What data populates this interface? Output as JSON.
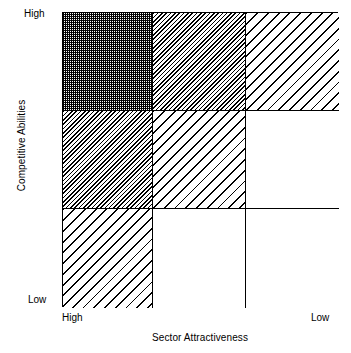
{
  "chart_data": {
    "type": "heatmap",
    "title": "",
    "xlabel": "Sector Attractiveness",
    "ylabel": "Competitive Abilities",
    "x_tick_labels": [
      "High",
      "Low"
    ],
    "y_tick_labels": [
      "High",
      "Low"
    ],
    "grid": true,
    "legend": "none",
    "columns": [
      "High",
      "Medium",
      "Low"
    ],
    "rows": [
      "High",
      "Medium",
      "Low"
    ],
    "cells": [
      {
        "row": 0,
        "col": 0,
        "fill": "stipple",
        "intensity": 3
      },
      {
        "row": 0,
        "col": 1,
        "fill": "hatch-dense",
        "intensity": 2
      },
      {
        "row": 0,
        "col": 2,
        "fill": "hatch-sparse",
        "intensity": 1
      },
      {
        "row": 1,
        "col": 0,
        "fill": "hatch-dense",
        "intensity": 2
      },
      {
        "row": 1,
        "col": 1,
        "fill": "hatch-sparse",
        "intensity": 1
      },
      {
        "row": 1,
        "col": 2,
        "fill": "blank",
        "intensity": 0
      },
      {
        "row": 2,
        "col": 0,
        "fill": "hatch-sparse",
        "intensity": 1
      },
      {
        "row": 2,
        "col": 1,
        "fill": "blank",
        "intensity": 0
      },
      {
        "row": 2,
        "col": 2,
        "fill": "blank",
        "intensity": 0
      }
    ]
  },
  "axes": {
    "y_title": "Competitive Abilities",
    "x_title": "Sector Attractiveness",
    "y_high": "High",
    "y_low": "Low",
    "x_high": "High",
    "x_low": "Low"
  },
  "colors": {
    "line": "#000000",
    "background": "#ffffff",
    "fill": "#000000"
  }
}
